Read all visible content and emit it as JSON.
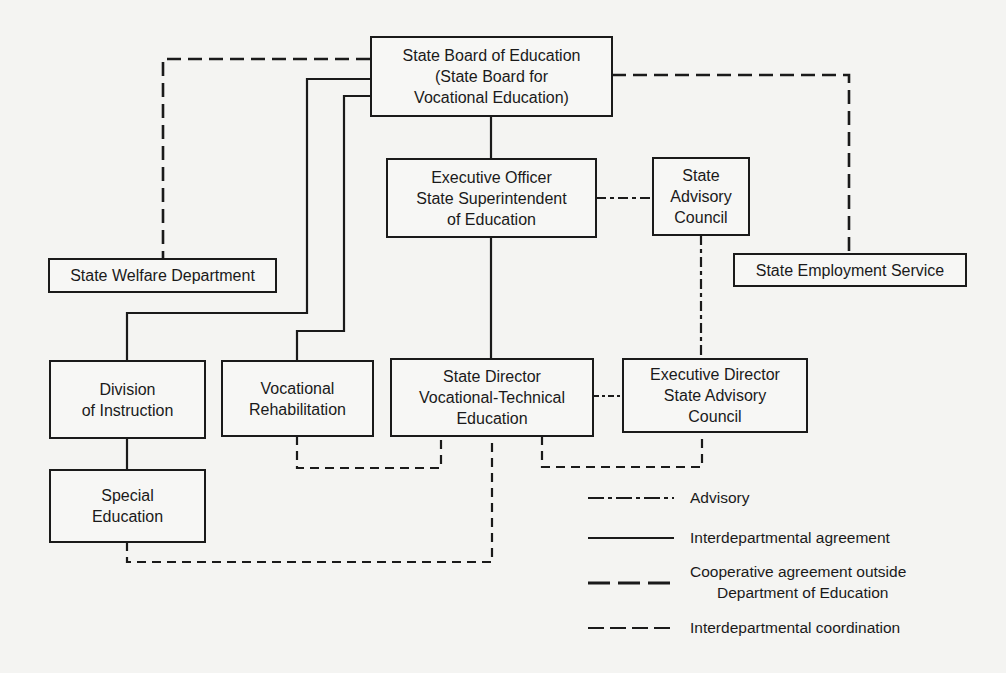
{
  "diagram": {
    "type": "organizational-chart",
    "nodes": {
      "state_board": {
        "lines": [
          "State Board of Education",
          "(State Board for",
          "Vocational Education)"
        ]
      },
      "executive_officer": {
        "lines": [
          "Executive Officer",
          "State Superintendent",
          "of Education"
        ]
      },
      "state_advisory_council": {
        "lines": [
          "State",
          "Advisory",
          "Council"
        ]
      },
      "state_welfare": {
        "lines": [
          "State Welfare Department"
        ]
      },
      "state_employment": {
        "lines": [
          "State Employment Service"
        ]
      },
      "division_instruction": {
        "lines": [
          "Division",
          "of Instruction"
        ]
      },
      "vocational_rehab": {
        "lines": [
          "Vocational",
          "Rehabilitation"
        ]
      },
      "state_director": {
        "lines": [
          "State Director",
          "Vocational-Technical",
          "Education"
        ]
      },
      "executive_director_sac": {
        "lines": [
          "Executive Director",
          "State Advisory",
          "Council"
        ]
      },
      "special_education": {
        "lines": [
          "Special",
          "Education"
        ]
      }
    },
    "edges": [
      {
        "from": "state_board",
        "to": "executive_officer",
        "style": "interdepartmental-agreement"
      },
      {
        "from": "executive_officer",
        "to": "state_advisory_council",
        "style": "advisory"
      },
      {
        "from": "state_board",
        "to": "state_welfare",
        "style": "cooperative-agreement"
      },
      {
        "from": "state_board",
        "to": "state_employment",
        "style": "cooperative-agreement"
      },
      {
        "from": "state_board",
        "to": "division_instruction",
        "style": "interdepartmental-agreement"
      },
      {
        "from": "state_board",
        "to": "vocational_rehab",
        "style": "interdepartmental-agreement"
      },
      {
        "from": "executive_officer",
        "to": "state_director",
        "style": "interdepartmental-agreement"
      },
      {
        "from": "state_advisory_council",
        "to": "executive_director_sac",
        "style": "advisory"
      },
      {
        "from": "state_director",
        "to": "executive_director_sac",
        "style": "advisory"
      },
      {
        "from": "division_instruction",
        "to": "special_education",
        "style": "interdepartmental-agreement"
      },
      {
        "from": "vocational_rehab",
        "to": "state_director",
        "style": "interdepartmental-coordination"
      },
      {
        "from": "state_director",
        "to": "executive_director_sac",
        "style": "interdepartmental-coordination"
      },
      {
        "from": "special_education",
        "to": "state_director",
        "style": "interdepartmental-coordination"
      }
    ]
  },
  "legend": {
    "items": [
      {
        "style": "advisory",
        "label": "Advisory"
      },
      {
        "style": "interdepartmental-agreement",
        "label": "Interdepartmental agreement"
      },
      {
        "style": "cooperative-agreement",
        "label_line1": "Cooperative agreement  outside",
        "label_line2": "Department of Education"
      },
      {
        "style": "interdepartmental-coordination",
        "label": "Interdepartmental coordination"
      }
    ]
  },
  "colors": {
    "ink": "#1a1a1a",
    "paper": "#f4f4f2"
  }
}
